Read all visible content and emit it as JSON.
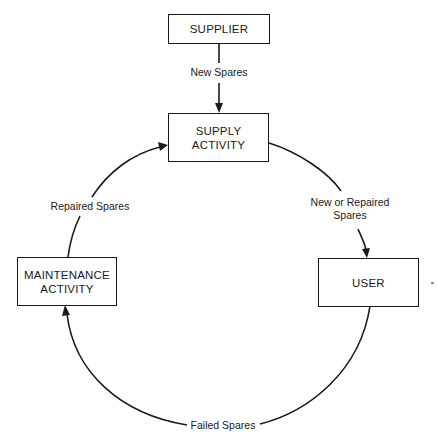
{
  "diagram": {
    "type": "flow-cycle",
    "nodes": {
      "supplier": {
        "id": "supplier",
        "lines": [
          "SUPPLIER"
        ]
      },
      "supply_activity": {
        "id": "supply_activity",
        "lines": [
          "SUPPLY",
          "ACTIVITY"
        ]
      },
      "user": {
        "id": "user",
        "lines": [
          "USER"
        ]
      },
      "maintenance_activity": {
        "id": "maintenance_activity",
        "lines": [
          "MAINTENANCE",
          "ACTIVITY"
        ]
      }
    },
    "edges": {
      "new_spares": {
        "from": "supplier",
        "to": "supply_activity",
        "lines": [
          "New Spares"
        ]
      },
      "new_or_repaired_spares": {
        "from": "supply_activity",
        "to": "user",
        "lines": [
          "New or Repaired",
          "Spares"
        ]
      },
      "failed_spares": {
        "from": "user",
        "to": "maintenance_activity",
        "lines": [
          "Failed Spares"
        ]
      },
      "repaired_spares": {
        "from": "maintenance_activity",
        "to": "supply_activity",
        "lines": [
          "Repaired Spares"
        ]
      }
    },
    "colors": {
      "stroke": "#1a1a1a",
      "background": "#ffffff"
    }
  }
}
